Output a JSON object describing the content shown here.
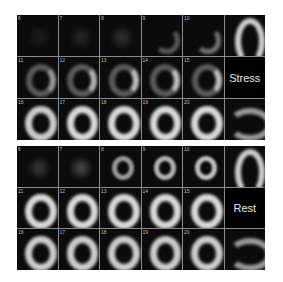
{
  "stress": {
    "label": "Stress",
    "frames": [
      {
        "num": "6",
        "intensity": 0.15,
        "type": "faint"
      },
      {
        "num": "7",
        "intensity": 0.2,
        "type": "faint"
      },
      {
        "num": "8",
        "intensity": 0.25,
        "type": "faint"
      },
      {
        "num": "9",
        "intensity": 0.35,
        "type": "partial"
      },
      {
        "num": "10",
        "intensity": 0.45,
        "type": "partial"
      },
      {
        "num": "11",
        "intensity": 0.6,
        "type": "ring-lateral"
      },
      {
        "num": "12",
        "intensity": 0.7,
        "type": "ring-lateral"
      },
      {
        "num": "13",
        "intensity": 0.75,
        "type": "ring-lateral"
      },
      {
        "num": "14",
        "intensity": 0.75,
        "type": "ring-lateral"
      },
      {
        "num": "15",
        "intensity": 0.75,
        "type": "ring-lateral"
      },
      {
        "num": "16",
        "intensity": 0.8,
        "type": "ring"
      },
      {
        "num": "17",
        "intensity": 0.85,
        "type": "ring"
      },
      {
        "num": "18",
        "intensity": 0.85,
        "type": "ring"
      },
      {
        "num": "19",
        "intensity": 0.85,
        "type": "ring"
      },
      {
        "num": "20",
        "intensity": 0.85,
        "type": "ring"
      }
    ]
  },
  "rest": {
    "label": "Rest",
    "frames": [
      {
        "num": "6",
        "intensity": 0.3,
        "type": "faint"
      },
      {
        "num": "7",
        "intensity": 0.4,
        "type": "faint"
      },
      {
        "num": "8",
        "intensity": 0.6,
        "type": "small-ring"
      },
      {
        "num": "9",
        "intensity": 0.7,
        "type": "small-ring"
      },
      {
        "num": "10",
        "intensity": 0.75,
        "type": "small-ring"
      },
      {
        "num": "11",
        "intensity": 0.85,
        "type": "ring"
      },
      {
        "num": "12",
        "intensity": 0.85,
        "type": "ring"
      },
      {
        "num": "13",
        "intensity": 0.85,
        "type": "ring"
      },
      {
        "num": "14",
        "intensity": 0.85,
        "type": "ring"
      },
      {
        "num": "15",
        "intensity": 0.85,
        "type": "ring"
      },
      {
        "num": "16",
        "intensity": 0.8,
        "type": "ring"
      },
      {
        "num": "17",
        "intensity": 0.8,
        "type": "ring"
      },
      {
        "num": "18",
        "intensity": 0.8,
        "type": "ring"
      },
      {
        "num": "19",
        "intensity": 0.8,
        "type": "ring"
      },
      {
        "num": "20",
        "intensity": 0.8,
        "type": "ring"
      }
    ]
  },
  "views": {
    "vertical_long_axis": "vertical-long-axis-view",
    "horizontal_long_axis": "horizontal-long-axis-view"
  }
}
